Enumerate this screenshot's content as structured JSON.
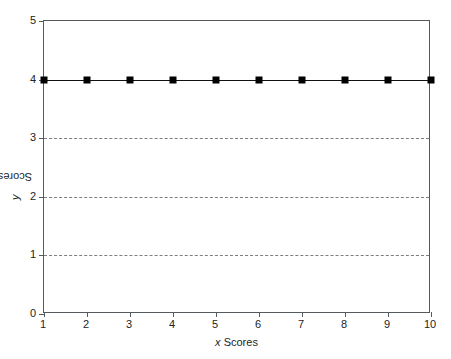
{
  "chart_data": {
    "type": "line",
    "title": "",
    "subtitle": "",
    "xlabel_prefix": "x",
    "xlabel_suffix": " Scores",
    "ylabel_prefix": "y",
    "ylabel_suffix": " Scores",
    "x": [
      1,
      2,
      3,
      4,
      5,
      6,
      7,
      8,
      9,
      10
    ],
    "series": [
      {
        "name": "",
        "values": [
          4,
          4,
          4,
          4,
          4,
          4,
          4,
          4,
          4,
          4
        ],
        "marker": "square",
        "marker_color": "#000000",
        "line_color": "#111111"
      }
    ],
    "xlim": [
      1,
      10
    ],
    "ylim": [
      0,
      5
    ],
    "xticks": [
      1,
      2,
      3,
      4,
      5,
      6,
      7,
      8,
      9,
      10
    ],
    "xticklabels": [
      "1",
      "2",
      "3",
      "4",
      "5",
      "6",
      "7",
      "8",
      "9",
      "10"
    ],
    "yticks": [
      0,
      1,
      2,
      3,
      4,
      5
    ],
    "yticklabels": [
      "0",
      "1",
      "2",
      "3",
      "4",
      "5"
    ],
    "gridlines_y": [
      1,
      2,
      3
    ],
    "grid": "horizontal-dashed",
    "grid_color": "#7b7f83",
    "frame_color": "#555a5e",
    "legend": "none",
    "background": "#ffffff"
  },
  "axes": {
    "x_title_italic": "x",
    "x_title_rest": " Scores",
    "y_title_italic": "y",
    "y_title_rest": " Scores"
  },
  "caption": {
    "cut_off_text": ""
  }
}
